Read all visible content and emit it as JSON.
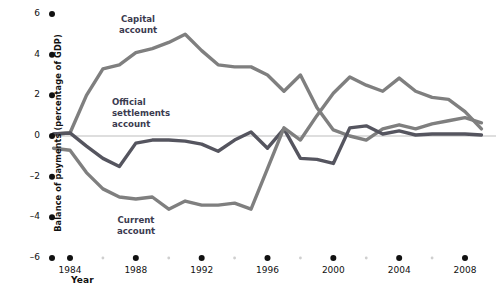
{
  "chart_data": {
    "type": "line",
    "title": "",
    "xlabel": "Year",
    "ylabel": "Balance of payments (percentage of GDP)",
    "xlim": [
      1983,
      2009
    ],
    "ylim": [
      -6,
      6
    ],
    "grid": false,
    "legend_position": "inline-annotations",
    "zero_line": true,
    "x_tick_labels": [
      "1984",
      "1988",
      "1992",
      "1996",
      "2000",
      "2004",
      "2008"
    ],
    "x_tick_values": [
      1984,
      1988,
      1992,
      1996,
      2000,
      2004,
      2008
    ],
    "y_tick_labels": [
      "6",
      "4",
      "2",
      "0",
      "-2",
      "-4",
      "-6"
    ],
    "y_tick_values": [
      6,
      4,
      2,
      0,
      -2,
      -4,
      -6
    ],
    "x": [
      1983,
      1984,
      1985,
      1986,
      1987,
      1988,
      1989,
      1990,
      1991,
      1992,
      1993,
      1994,
      1995,
      1996,
      1997,
      1998,
      1999,
      2000,
      2001,
      2002,
      2003,
      2004,
      2005,
      2006,
      2007,
      2008,
      2009
    ],
    "series": [
      {
        "name": "Capital account",
        "color": "#7f7f7f",
        "values": [
          0.1,
          0.15,
          2.0,
          3.3,
          3.5,
          4.1,
          4.3,
          4.6,
          5.0,
          4.2,
          3.5,
          3.4,
          3.4,
          3.0,
          2.2,
          3.0,
          1.4,
          0.3,
          0.0,
          -0.2,
          0.35,
          0.55,
          0.35,
          0.6,
          0.75,
          0.9,
          0.65
        ]
      },
      {
        "name": "Official settlements account",
        "color": "#55555f",
        "values": [
          0.1,
          0.15,
          -0.5,
          -1.1,
          -1.5,
          -0.35,
          -0.2,
          -0.2,
          -0.25,
          -0.4,
          -0.75,
          -0.2,
          0.2,
          -0.6,
          0.35,
          -1.1,
          -1.15,
          -1.35,
          0.4,
          0.5,
          0.1,
          0.25,
          0.05,
          0.1,
          0.1,
          0.1,
          0.05
        ]
      },
      {
        "name": "Current account",
        "color": "#7f7f7f",
        "values": [
          -0.6,
          -0.7,
          -1.8,
          -2.6,
          -3.0,
          -3.1,
          -3.0,
          -3.6,
          -3.2,
          -3.4,
          -3.4,
          -3.3,
          -3.6,
          -1.6,
          0.4,
          -0.2,
          1.0,
          2.1,
          2.9,
          2.5,
          2.2,
          2.85,
          2.2,
          1.9,
          1.8,
          1.2,
          0.35
        ]
      }
    ],
    "annotations": [
      {
        "id": "capital",
        "text": "Capital\naccount"
      },
      {
        "id": "official",
        "text": "Official\nsettlements\naccount"
      },
      {
        "id": "current",
        "text": "Current\naccount"
      }
    ]
  },
  "style": {
    "background": "#ffffff",
    "tick_dot_color": "#111111",
    "minor_dot_color": "#cfcfcf",
    "zero_line_color": "#bdbdbd",
    "text_color": "#111111",
    "annotation_color": "#3b3b4f"
  }
}
